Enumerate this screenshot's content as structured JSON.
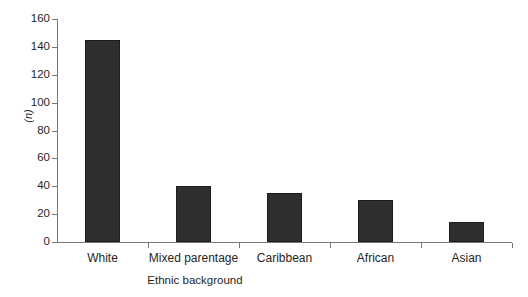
{
  "chart_data": {
    "type": "bar",
    "title": "",
    "subtitle": "",
    "xlabel": "Ethnic background",
    "ylabel": "(n)",
    "categories": [
      "White",
      "Mixed parentage",
      "Caribbean",
      "African",
      "Asian"
    ],
    "values": [
      145,
      40,
      35,
      30,
      14
    ],
    "series": [
      {
        "name": "Number of participants",
        "values": [
          145,
          40,
          35,
          30,
          14
        ]
      }
    ],
    "ylim": [
      0,
      160
    ],
    "y_ticks": [
      0,
      20,
      40,
      60,
      80,
      100,
      120,
      140,
      160
    ],
    "y_tick_labels": [
      "0",
      "20",
      "40",
      "60",
      "80",
      "100",
      "120",
      "140",
      "160"
    ],
    "grid": false,
    "legend": false,
    "legend_position": "none",
    "bar_color": "#2f2f2f",
    "bar_edge_color": "#1c1c1c",
    "axis_color": "#777777",
    "background_color": "#ffffff",
    "annotations": []
  }
}
